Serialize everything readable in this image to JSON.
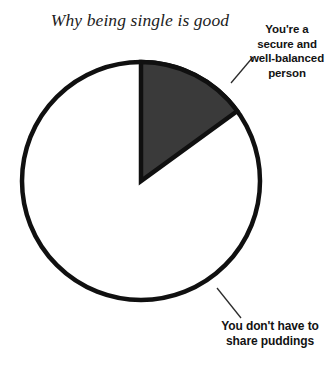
{
  "image": {
    "width": 336,
    "height": 368,
    "background_color": "#ffffff"
  },
  "chart_data": {
    "type": "pie",
    "title": "Why being single is good",
    "xlabel": "",
    "ylabel": "",
    "legend_position": "none",
    "grid": false,
    "labels_as_callouts": true,
    "categories": [
      "You're a secure and well-balanced person",
      "You don't have to share puddings"
    ],
    "values": [
      15,
      85
    ],
    "units": "percent",
    "start_angle_deg": 0,
    "direction": "clockwise",
    "slices": [
      {
        "label": "You're a secure and well-balanced person",
        "label_lines": [
          "You're a",
          "secure and",
          "well-balanced",
          "person"
        ],
        "value": 15,
        "start_angle_deg": 0,
        "end_angle_deg": 54,
        "fill_color": "#3a3a3a",
        "stroke_color": "#101010"
      },
      {
        "label": "You don't have to share puddings",
        "label_lines": [
          "You don't have to",
          "share puddings"
        ],
        "value": 85,
        "start_angle_deg": 54,
        "end_angle_deg": 360,
        "fill_color": "#ffffff",
        "stroke_color": "#101010"
      }
    ],
    "geometry": {
      "center_x": 141,
      "center_y": 181,
      "radius": 119,
      "stroke_width": 4.5
    },
    "leader_lines": [
      {
        "name": "leader-secure",
        "x1": 231,
        "y1": 83,
        "x2": 253,
        "y2": 57
      },
      {
        "name": "leader-puddings",
        "x1": 217,
        "y1": 288,
        "x2": 241,
        "y2": 318
      }
    ]
  }
}
